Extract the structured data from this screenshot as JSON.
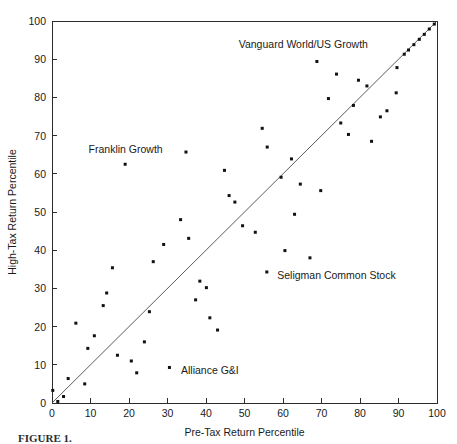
{
  "chart_data": {
    "type": "scatter",
    "title": "",
    "xlabel": "Pre-Tax Return Percentile",
    "ylabel": "High-Tax Return Percentile",
    "xlim": [
      0,
      100
    ],
    "ylim": [
      0,
      100
    ],
    "xticks": [
      0,
      10,
      20,
      30,
      40,
      50,
      60,
      70,
      80,
      90,
      100
    ],
    "yticks": [
      0,
      10,
      20,
      30,
      40,
      50,
      60,
      70,
      80,
      90,
      100
    ],
    "xticklabels": [
      "0",
      "10",
      "20",
      "30",
      "40",
      "50",
      "60",
      "70",
      "80",
      "90",
      "100"
    ],
    "yticklabels": [
      "0",
      "10",
      "20",
      "30",
      "40",
      "50",
      "60",
      "70",
      "80",
      "90",
      "100"
    ],
    "grid": false,
    "legend": "none",
    "marker": "square",
    "marker_color": "#111111",
    "reference_line": {
      "name": "45-degree identity line",
      "from": [
        0,
        0
      ],
      "to": [
        100,
        100
      ],
      "color": "#4a4a4a"
    },
    "points": [
      [
        0.2,
        3.3
      ],
      [
        1.5,
        0.4
      ],
      [
        3.0,
        1.7
      ],
      [
        4.2,
        6.4
      ],
      [
        6.2,
        20.9
      ],
      [
        8.5,
        5.0
      ],
      [
        9.3,
        14.3
      ],
      [
        11.0,
        17.6
      ],
      [
        13.3,
        25.5
      ],
      [
        14.2,
        28.8
      ],
      [
        15.7,
        35.4
      ],
      [
        17.0,
        12.5
      ],
      [
        19.0,
        62.5
      ],
      [
        20.6,
        11.0
      ],
      [
        22.0,
        7.9
      ],
      [
        24.0,
        16.0
      ],
      [
        25.3,
        23.9
      ],
      [
        26.3,
        37.0
      ],
      [
        29.0,
        41.5
      ],
      [
        30.5,
        9.3
      ],
      [
        33.4,
        48.0
      ],
      [
        34.8,
        65.7
      ],
      [
        35.5,
        43.1
      ],
      [
        37.3,
        27.0
      ],
      [
        38.4,
        31.9
      ],
      [
        40.1,
        30.2
      ],
      [
        41.0,
        22.3
      ],
      [
        43.0,
        19.1
      ],
      [
        44.8,
        60.9
      ],
      [
        46.0,
        54.3
      ],
      [
        47.5,
        52.6
      ],
      [
        49.5,
        46.4
      ],
      [
        52.8,
        44.7
      ],
      [
        54.6,
        71.9
      ],
      [
        55.8,
        34.3
      ],
      [
        55.9,
        67.0
      ],
      [
        59.5,
        59.1
      ],
      [
        60.5,
        39.9
      ],
      [
        62.2,
        63.9
      ],
      [
        64.5,
        57.3
      ],
      [
        67.0,
        38.0
      ],
      [
        63.0,
        49.4
      ],
      [
        68.8,
        89.4
      ],
      [
        69.8,
        55.6
      ],
      [
        71.8,
        79.7
      ],
      [
        73.9,
        86.1
      ],
      [
        75.0,
        73.3
      ],
      [
        77.0,
        70.3
      ],
      [
        78.3,
        77.9
      ],
      [
        79.6,
        84.5
      ],
      [
        81.8,
        83.0
      ],
      [
        83.0,
        68.5
      ],
      [
        85.3,
        74.9
      ],
      [
        87.0,
        76.5
      ],
      [
        89.4,
        81.2
      ],
      [
        89.6,
        87.8
      ],
      [
        91.5,
        91.3
      ],
      [
        92.6,
        92.4
      ],
      [
        94.0,
        93.8
      ],
      [
        95.4,
        95.2
      ],
      [
        96.7,
        96.5
      ],
      [
        98.0,
        97.9
      ],
      [
        99.3,
        99.2
      ]
    ],
    "annotations": [
      {
        "label": "Vanguard World/US Growth",
        "point": [
          68.8,
          89.4
        ],
        "text_x": 48.5,
        "text_y": 94.0,
        "anchor": "start"
      },
      {
        "label": "Franklin Growth",
        "point": [
          19.0,
          62.5
        ],
        "text_x": 9.5,
        "text_y": 66.5,
        "anchor": "start"
      },
      {
        "label": "Seligman Common Stock",
        "point": [
          55.8,
          34.3
        ],
        "text_x": 58.5,
        "text_y": 33.4,
        "anchor": "start"
      },
      {
        "label": "Alliance G&I",
        "point": [
          30.5,
          9.3
        ],
        "text_x": 33.5,
        "text_y": 8.6,
        "anchor": "start"
      }
    ]
  },
  "caption": {
    "figure_number": "FIGURE 1.",
    "text": ""
  }
}
